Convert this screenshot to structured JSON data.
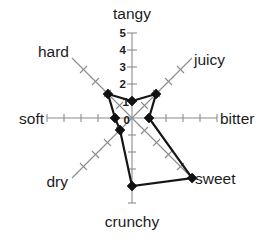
{
  "chart_data": {
    "type": "radar",
    "title": "",
    "subtitle": "",
    "xlabel": "",
    "ylabel": "",
    "grid": false,
    "legend": "none",
    "radial_axis": {
      "min": 0,
      "max": 5,
      "tick_step": 1,
      "tick_labels": [
        "0",
        "1",
        "2",
        "3",
        "4",
        "5"
      ],
      "labels_on_axis": "tangy"
    },
    "categories": [
      "tangy",
      "juicy",
      "bitter",
      "sweet",
      "crunchy",
      "dry",
      "soft",
      "hard"
    ],
    "values": [
      1,
      2,
      1,
      5,
      4,
      1,
      1,
      2
    ],
    "series": [
      {
        "name": "",
        "values": [
          1,
          2,
          1,
          5,
          4,
          1,
          1,
          2
        ]
      }
    ],
    "axis_angles_deg": [
      90,
      45,
      0,
      -45,
      -90,
      -135,
      180,
      135
    ],
    "marker": "diamond",
    "line_color": "#161616",
    "axis_color": "#8c8c8c"
  },
  "labels": {
    "tangy": "tangy",
    "juicy": "juicy",
    "bitter": "bitter",
    "sweet": "sweet",
    "crunchy": "crunchy",
    "dry": "dry",
    "soft": "soft",
    "hard": "hard"
  },
  "radial_ticks": {
    "t0": "0",
    "t1": "1",
    "t2": "2",
    "t3": "3",
    "t4": "4",
    "t5": "5"
  }
}
